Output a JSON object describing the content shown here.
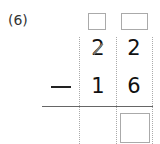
{
  "problem": {
    "label": "(6)",
    "operation": "subtraction",
    "minuend": {
      "tens": "2",
      "ones": "2",
      "tens_crossed_out": true
    },
    "subtrahend": {
      "tens": "1",
      "ones": "6"
    },
    "operator_symbol": "−",
    "carry_boxes": [
      "",
      ""
    ],
    "answer_boxes": [
      ""
    ]
  }
}
